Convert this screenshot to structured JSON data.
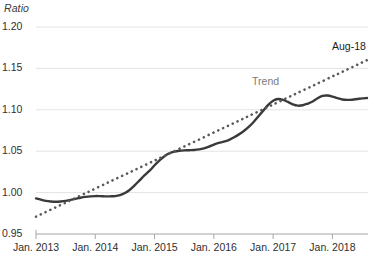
{
  "chart_data": {
    "type": "line",
    "title": "",
    "ylabel": "Ratio",
    "xlabel": "",
    "ylim": [
      0.95,
      1.2
    ],
    "yticks": [
      "0.95",
      "1.00",
      "1.05",
      "1.10",
      "1.15",
      "1.20"
    ],
    "ytick_values": [
      0.95,
      1.0,
      1.05,
      1.1,
      1.15,
      1.2
    ],
    "xticks": [
      "Jan. 2013",
      "Jan. 2014",
      "Jan. 2015",
      "Jan. 2016",
      "Jan. 2017",
      "Jan. 2018"
    ],
    "xtick_values": [
      2013.0,
      2014.0,
      2015.0,
      2016.0,
      2017.0,
      2018.0
    ],
    "xlim": [
      2013.0,
      2018.6
    ],
    "grid": "horizontal",
    "legend": "none",
    "annotations": [
      {
        "name": "series-end-label",
        "text": "Aug-18",
        "x": 2018.6,
        "y": 1.176
      },
      {
        "name": "trend-label",
        "text": "Trend",
        "x": 2017.05,
        "y": 1.134
      }
    ],
    "series": [
      {
        "name": "Ratio",
        "style": "solid",
        "color": "#3a3a3a",
        "x": [
          2013.0,
          2013.083,
          2013.167,
          2013.25,
          2013.333,
          2013.417,
          2013.5,
          2013.583,
          2013.667,
          2013.75,
          2013.833,
          2013.917,
          2014.0,
          2014.083,
          2014.167,
          2014.25,
          2014.333,
          2014.417,
          2014.5,
          2014.583,
          2014.667,
          2014.75,
          2014.833,
          2014.917,
          2015.0,
          2015.083,
          2015.167,
          2015.25,
          2015.333,
          2015.417,
          2015.5,
          2015.583,
          2015.667,
          2015.75,
          2015.833,
          2015.917,
          2016.0,
          2016.083,
          2016.167,
          2016.25,
          2016.333,
          2016.417,
          2016.5,
          2016.583,
          2016.667,
          2016.75,
          2016.833,
          2016.917,
          2017.0,
          2017.083,
          2017.167,
          2017.25,
          2017.333,
          2017.417,
          2017.5,
          2017.583,
          2017.667,
          2017.75,
          2017.833,
          2017.917,
          2018.0,
          2018.083,
          2018.167,
          2018.25,
          2018.333,
          2018.417,
          2018.5,
          2018.583
        ],
        "values": [
          0.993,
          0.9915,
          0.99,
          0.9893,
          0.989,
          0.9893,
          0.99,
          0.9912,
          0.9925,
          0.9938,
          0.9948,
          0.9955,
          0.9958,
          0.9957,
          0.9955,
          0.9955,
          0.9958,
          0.997,
          0.9995,
          1.0035,
          1.009,
          1.015,
          1.021,
          1.0265,
          1.033,
          1.039,
          1.044,
          1.0475,
          1.0495,
          1.0505,
          1.051,
          1.0512,
          1.0515,
          1.0522,
          1.0535,
          1.0555,
          1.058,
          1.06,
          1.0615,
          1.0635,
          1.0665,
          1.07,
          1.074,
          1.079,
          1.085,
          1.092,
          1.099,
          1.106,
          1.111,
          1.113,
          1.112,
          1.1095,
          1.1065,
          1.105,
          1.1055,
          1.1075,
          1.11,
          1.114,
          1.1168,
          1.1172,
          1.116,
          1.114,
          1.1125,
          1.112,
          1.1122,
          1.113,
          1.1138,
          1.1142
        ]
      },
      {
        "name": "Trend",
        "style": "dotted",
        "color": "#595959",
        "x": [
          2013.0,
          2018.583
        ],
        "values": [
          0.971,
          1.16
        ]
      }
    ]
  }
}
